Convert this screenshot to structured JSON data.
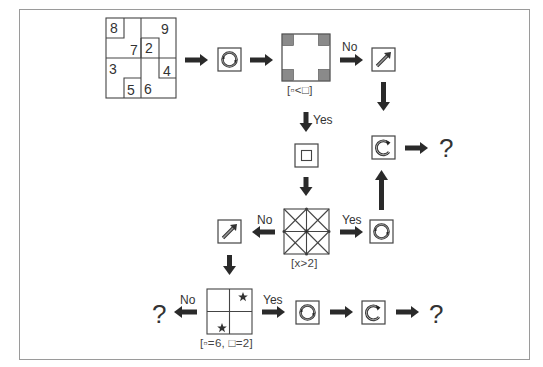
{
  "diagram": {
    "type": "flowchart-puzzle",
    "start_grid": {
      "cells": [
        {
          "value": "8",
          "x": 110,
          "y": 19
        },
        {
          "value": "9",
          "x": 161,
          "y": 21
        },
        {
          "value": "7",
          "x": 136,
          "y": 41
        },
        {
          "value": "2",
          "x": 145,
          "y": 41
        },
        {
          "value": "3",
          "x": 109,
          "y": 62
        },
        {
          "value": "4",
          "x": 162,
          "y": 63
        },
        {
          "value": "5",
          "x": 127,
          "y": 83
        },
        {
          "value": "6",
          "x": 145,
          "y": 82
        }
      ]
    },
    "nodes": {
      "rotate_full_1": {
        "icon": "full-cycle-icon"
      },
      "corner_check": {
        "caption": "[▫<□]"
      },
      "diagonal_arrow_1": {
        "icon": "diagonal-arrow-icon"
      },
      "rotate_partial_1": {
        "icon": "partial-cycle-icon"
      },
      "nested_square": {
        "icon": "nested-square-icon"
      },
      "x_grid_check": {
        "caption": "[x>2]"
      },
      "rotate_full_2": {
        "icon": "full-cycle-icon"
      },
      "diagonal_arrow_2": {
        "icon": "diagonal-arrow-icon"
      },
      "star_check": {
        "caption": "[▫=6, □=2]"
      },
      "rotate_full_3": {
        "icon": "full-cycle-icon"
      },
      "rotate_partial_2": {
        "icon": "partial-cycle-icon"
      }
    },
    "labels": {
      "no_1": "No",
      "yes_1": "Yes",
      "yes_2": "Yes",
      "no_2": "No",
      "no_3": "No",
      "yes_3": "Yes"
    },
    "outputs": {
      "q1": "?",
      "q2": "?",
      "q3": "?"
    },
    "colors": {
      "stroke": "#333333",
      "arrow": "#2a2a2a",
      "corner_fill": "#8a8a8a",
      "frame": "#9a9a9a"
    }
  }
}
